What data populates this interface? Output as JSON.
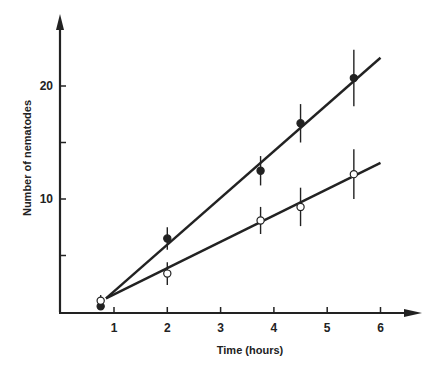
{
  "chart_data": {
    "type": "scatter",
    "title": "",
    "xlabel": "Time (hours)",
    "ylabel": "Number of nematodes",
    "xlim": [
      0,
      6.7
    ],
    "ylim": [
      0,
      24
    ],
    "x_ticks": [
      1,
      2,
      3,
      4,
      5,
      6
    ],
    "y_ticks": [
      5,
      10,
      15,
      20
    ],
    "y_tick_labels": [
      "",
      "10",
      "",
      "20"
    ],
    "grid": false,
    "legend": null,
    "series": [
      {
        "name": "filled circles",
        "marker": "filled-circle",
        "x": [
          0.75,
          2,
          3.75,
          4.5,
          5.5
        ],
        "values": [
          0.5,
          6.5,
          12.5,
          16.7,
          20.7
        ],
        "error": [
          0,
          1.0,
          1.3,
          1.7,
          2.5
        ],
        "fit_line": {
          "x0": 0.85,
          "y0": 1.2,
          "x1": 6.0,
          "y1": 22.5
        }
      },
      {
        "name": "open circles",
        "marker": "open-circle",
        "x": [
          0.75,
          2,
          3.75,
          4.5,
          5.5
        ],
        "values": [
          1.0,
          3.4,
          8.1,
          9.3,
          12.2
        ],
        "error": [
          0.5,
          1.0,
          1.2,
          1.7,
          2.2
        ],
        "fit_line": {
          "x0": 0.85,
          "y0": 1.2,
          "x1": 6.0,
          "y1": 13.2
        }
      }
    ]
  }
}
